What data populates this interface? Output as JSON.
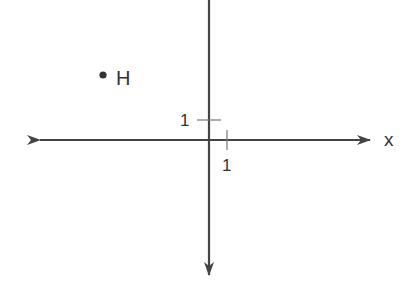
{
  "diagram": {
    "type": "coordinate-plane",
    "colors": {
      "axis": "#444444",
      "tick": "#666666",
      "text": "#333333",
      "point": "#333333",
      "background": "#ffffff"
    },
    "axes": {
      "x": {
        "label": "x",
        "has_left_arrow": true,
        "has_right_arrow": true
      },
      "y": {
        "label": "",
        "has_top_arrow": false,
        "has_bottom_arrow": true
      }
    },
    "ticks": {
      "x_unit_label": "1",
      "y_unit_label": "1"
    },
    "points": [
      {
        "name": "H",
        "label": "H",
        "approx_coords": [
          -5.8,
          3.5
        ]
      }
    ]
  }
}
